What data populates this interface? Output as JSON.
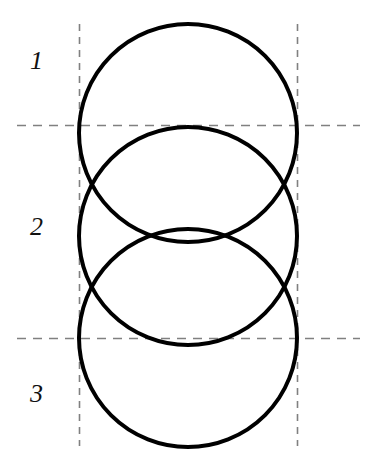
{
  "figure": {
    "width": 372,
    "height": 462,
    "background_color": "#ffffff",
    "stroke_color": "#000000",
    "dash_color": "#808080"
  },
  "labels": {
    "region_1": "1",
    "region_2": "2",
    "region_3": "3"
  },
  "chart_data": {
    "type": "diagram",
    "background": "#ffffff",
    "circles": [
      {
        "name": "circle-1",
        "cx": 188,
        "cy": 133,
        "r": 109,
        "stroke": "#000000",
        "stroke_width": 4,
        "fill": "none"
      },
      {
        "name": "circle-2",
        "cx": 188,
        "cy": 236,
        "r": 109,
        "stroke": "#000000",
        "stroke_width": 4,
        "fill": "none"
      },
      {
        "name": "circle-3",
        "cx": 188,
        "cy": 338,
        "r": 109,
        "stroke": "#000000",
        "stroke_width": 4,
        "fill": "none"
      }
    ],
    "dashed_lines": [
      {
        "name": "vertical-left",
        "orientation": "vertical",
        "x": 79,
        "y1": 24,
        "y2": 446,
        "stroke": "#808080",
        "dash": "7 6"
      },
      {
        "name": "vertical-right",
        "orientation": "vertical",
        "x": 297,
        "y1": 24,
        "y2": 446,
        "stroke": "#808080",
        "dash": "7 6"
      },
      {
        "name": "horizontal-top",
        "orientation": "horizontal",
        "y": 125,
        "x1": 17,
        "x2": 360,
        "stroke": "#808080",
        "dash": "9 7"
      },
      {
        "name": "horizontal-bottom",
        "orientation": "horizontal",
        "y": 338,
        "x1": 17,
        "x2": 360,
        "stroke": "#808080",
        "dash": "9 7"
      }
    ],
    "region_labels": [
      {
        "text": "1",
        "x": 40,
        "y": 62,
        "style": "italic-serif"
      },
      {
        "text": "2",
        "x": 40,
        "y": 228,
        "style": "italic-serif"
      },
      {
        "text": "3",
        "x": 40,
        "y": 395,
        "style": "italic-serif"
      }
    ]
  }
}
